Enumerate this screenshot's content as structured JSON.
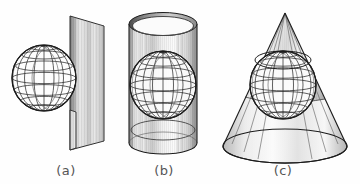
{
  "figure": {
    "background_color": "#fefefe",
    "stroke_color": "#1c1c1c",
    "caption_color": "#555555",
    "width": 360,
    "height": 184,
    "panels": [
      {
        "id": "a",
        "caption": "(a)",
        "caption_x": 66,
        "caption_y": 175,
        "description": "sphere-with-tangent-plane",
        "shapes": [
          {
            "name": "tangent-plane",
            "type": "parallelogram",
            "points": "70,16 104,26 104,141 70,150",
            "shading": "vertical-gradient-light-gray"
          },
          {
            "name": "wireframe-sphere",
            "type": "sphere",
            "cx": 44,
            "cy": 78,
            "rx": 32,
            "ry": 33,
            "meridians": 7,
            "parallels": 6
          }
        ]
      },
      {
        "id": "b",
        "caption": "(b)",
        "caption_x": 164,
        "caption_y": 175,
        "description": "sphere-inscribed-in-cylinder",
        "shapes": [
          {
            "name": "cylinder",
            "type": "cylinder",
            "cx": 163,
            "top_cy": 24,
            "bottom_cy": 143,
            "rx": 34,
            "ry": 11,
            "open_top": true,
            "wall_thickness": 2.5,
            "shading": "vertical-gradient-light-gray"
          },
          {
            "name": "wireframe-sphere",
            "type": "sphere",
            "cx": 163,
            "cy": 85,
            "rx": 33,
            "ry": 34,
            "meridians": 7,
            "parallels": 6
          },
          {
            "name": "cylinder-base-ellipse",
            "type": "ellipse",
            "cx": 163,
            "cy": 130,
            "rx": 32,
            "ry": 10
          }
        ]
      },
      {
        "id": "c",
        "caption": "(c)",
        "caption_x": 283,
        "caption_y": 175,
        "description": "sphere-inscribed-in-cone",
        "shapes": [
          {
            "name": "cone",
            "type": "cone",
            "apex_x": 285,
            "apex_y": 13,
            "base_cx": 285,
            "base_cy": 146,
            "base_rx": 62,
            "base_ry": 17,
            "shading": "radial-gradient-light-gray"
          },
          {
            "name": "wireframe-sphere",
            "type": "sphere",
            "cx": 283,
            "cy": 85,
            "rx": 33,
            "ry": 34,
            "meridians": 7,
            "parallels": 6
          },
          {
            "name": "tangency-circle",
            "type": "ellipse",
            "cx": 283,
            "cy": 60,
            "rx": 28,
            "ry": 9
          }
        ]
      }
    ]
  }
}
